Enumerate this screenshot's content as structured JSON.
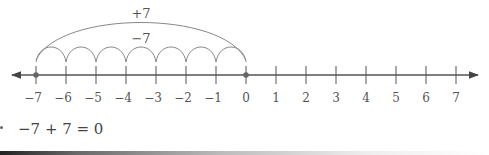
{
  "number_line": {
    "min": -7,
    "max": 7,
    "ticks": [
      "−7",
      "−6",
      "−5",
      "−4",
      "−3",
      "−2",
      "−1",
      "0",
      "1",
      "2",
      "3",
      "4",
      "5",
      "6",
      "7"
    ],
    "marked_points": [
      -7,
      0
    ],
    "colors": {
      "line": "#555555",
      "arc": "#888888",
      "point": "#666666",
      "text": "#555555"
    }
  },
  "arcs": {
    "big_label": "+7",
    "small_label": "−7",
    "big_from": -7,
    "big_to": 0,
    "small_hops": 7
  },
  "equation": {
    "text": "−7 + 7 = 0"
  }
}
